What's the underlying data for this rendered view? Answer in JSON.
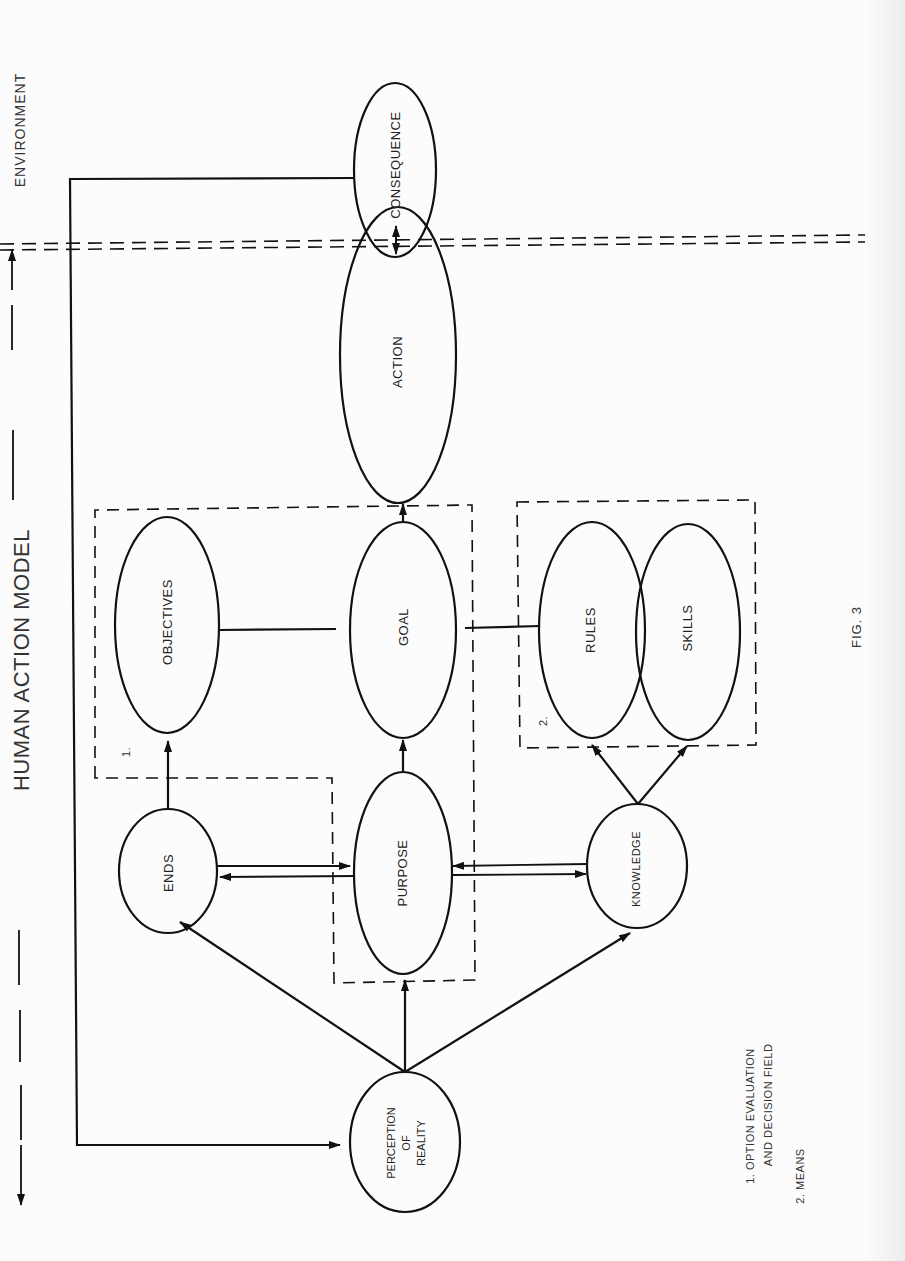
{
  "title": "HUMAN ACTION MODEL",
  "environment_label": "ENVIRONMENT",
  "figure_label": "FIG. 3",
  "nodes": {
    "consequence": "CONSEQUENCE",
    "action": "ACTION",
    "objectives": "OBJECTIVES",
    "goal": "GOAL",
    "rules": "RULES",
    "skills": "SKILLS",
    "ends": "ENDS",
    "purpose": "PURPOSE",
    "knowledge": "KNOWLEDGE",
    "perception": {
      "line1": "PERCEPTION",
      "line2": "OF",
      "line3": "REALITY"
    }
  },
  "regions": {
    "region1_marker": "1.",
    "region2_marker": "2."
  },
  "legend": {
    "item1_line1": "1.  OPTION EVALUATION",
    "item1_line2": "AND DECISION FIELD",
    "item2": "2.  MEANS"
  },
  "edges": [
    {
      "from": "Perception of Reality",
      "to": "Ends"
    },
    {
      "from": "Perception of Reality",
      "to": "Purpose"
    },
    {
      "from": "Perception of Reality",
      "to": "Knowledge"
    },
    {
      "from": "Ends",
      "to": "Purpose",
      "bidirectional": true
    },
    {
      "from": "Purpose",
      "to": "Knowledge",
      "bidirectional": true
    },
    {
      "from": "Ends",
      "to": "Objectives"
    },
    {
      "from": "Purpose",
      "to": "Goal"
    },
    {
      "from": "Objectives",
      "to": "Goal",
      "type": "line"
    },
    {
      "from": "Goal",
      "to": "Rules",
      "type": "line"
    },
    {
      "from": "Knowledge",
      "to": "Rules"
    },
    {
      "from": "Knowledge",
      "to": "Skills"
    },
    {
      "from": "Goal",
      "to": "Action"
    },
    {
      "from": "Action",
      "to": "Consequence",
      "bidirectional": true
    },
    {
      "from": "Consequence",
      "to": "Perception of Reality",
      "type": "feedback"
    }
  ]
}
